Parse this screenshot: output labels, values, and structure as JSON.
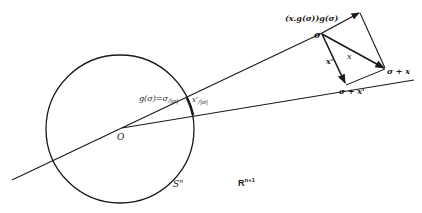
{
  "figure": {
    "labels": {
      "origin": "O",
      "sphere": "S",
      "sphere_sup": "n",
      "space": "R",
      "space_sup": "n+1",
      "g_sigma": "g(σ)=σ",
      "g_sigma_sub": "/|σ|",
      "x_prime_proj": "x'",
      "x_prime_proj_sub": "/|σ|",
      "projection_vector": "(x.g(σ))g(σ)",
      "sigma": "σ",
      "x": "x",
      "x_prime": "x'",
      "sigma_plus_x": "σ + x",
      "sigma_plus_x_prime": "σ + x'"
    },
    "colors": {
      "ink": "#1a1a1a",
      "background": "#ffffff"
    }
  }
}
